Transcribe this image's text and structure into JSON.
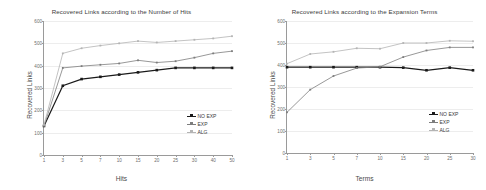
{
  "figure": {
    "background": "#ffffff",
    "panels": [
      "hits-panel",
      "terms-panel"
    ]
  },
  "series_style": {
    "no_exp_color": "#1a1a1a",
    "exp_color": "#7d7d7d",
    "alg_color": "#b4b4b4"
  },
  "legend": {
    "entries": [
      {
        "label": "NO EXP",
        "color": "#1a1a1a",
        "marker": "square"
      },
      {
        "label": "EXP",
        "color": "#7d7d7d",
        "marker": "square"
      },
      {
        "label": "ALG",
        "color": "#b4b4b4",
        "marker": "square"
      }
    ]
  },
  "chart_data": [
    {
      "id": "hits-chart",
      "type": "line",
      "title": "Recovered Links according to the Number of Hits",
      "xlabel": "Hits",
      "ylabel": "Recovered Links",
      "categories": [
        "1",
        "3",
        "5",
        "7",
        "10",
        "15",
        "20",
        "25",
        "30",
        "40",
        "50"
      ],
      "yticks": [
        "0",
        "100",
        "200",
        "300",
        "400",
        "500",
        "600"
      ],
      "ylim": [
        0,
        600
      ],
      "grid": true,
      "legend_position": "lower-right",
      "series": [
        {
          "name": "NO EXP",
          "color": "#1a1a1a",
          "values": [
            130,
            310,
            340,
            350,
            360,
            370,
            380,
            390,
            390,
            390,
            390
          ]
        },
        {
          "name": "EXP",
          "color": "#7d7d7d",
          "values": [
            130,
            390,
            398,
            404,
            410,
            424,
            414,
            420,
            436,
            455,
            465
          ]
        },
        {
          "name": "ALG",
          "color": "#b4b4b4",
          "values": [
            135,
            455,
            478,
            490,
            500,
            510,
            504,
            510,
            516,
            522,
            532
          ]
        }
      ]
    },
    {
      "id": "terms-chart",
      "type": "line",
      "title": "Recovered Links according to the Expansion Terms",
      "xlabel": "Terms",
      "ylabel": "Recovered Links",
      "categories": [
        "1",
        "3",
        "5",
        "7",
        "10",
        "15",
        "20",
        "25",
        "30"
      ],
      "yticks": [
        "0",
        "100",
        "200",
        "300",
        "400",
        "500",
        "600"
      ],
      "ylim": [
        0,
        600
      ],
      "grid": true,
      "legend_position": "lower-right",
      "series": [
        {
          "name": "NO EXP",
          "color": "#1a1a1a",
          "values": [
            390,
            390,
            390,
            390,
            390,
            388,
            376,
            388,
            376
          ]
        },
        {
          "name": "EXP",
          "color": "#7d7d7d",
          "values": [
            185,
            288,
            350,
            386,
            392,
            436,
            466,
            480,
            480
          ]
        },
        {
          "name": "ALG",
          "color": "#b4b4b4",
          "values": [
            406,
            450,
            460,
            476,
            474,
            500,
            500,
            510,
            508
          ]
        }
      ]
    }
  ]
}
